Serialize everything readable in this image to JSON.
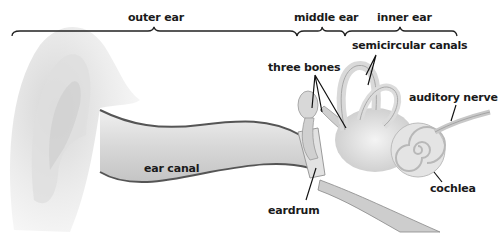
{
  "diagram": {
    "sections": [
      {
        "label": "outer ear"
      },
      {
        "label": "middle ear"
      },
      {
        "label": "inner ear"
      }
    ],
    "parts": [
      {
        "label": "semicircular canals"
      },
      {
        "label": "three bones"
      },
      {
        "label": "auditory nerve"
      },
      {
        "label": "ear canal"
      },
      {
        "label": "eardrum"
      },
      {
        "label": "cochlea"
      }
    ],
    "colors": {
      "background": "#ffffff",
      "text": "#1a1a1a",
      "bracket": "#222222",
      "tissue_light": "#ececec",
      "tissue_mid": "#c8c8c8",
      "tissue_dark": "#8a8a8a",
      "canal_edge": "#555555"
    }
  }
}
